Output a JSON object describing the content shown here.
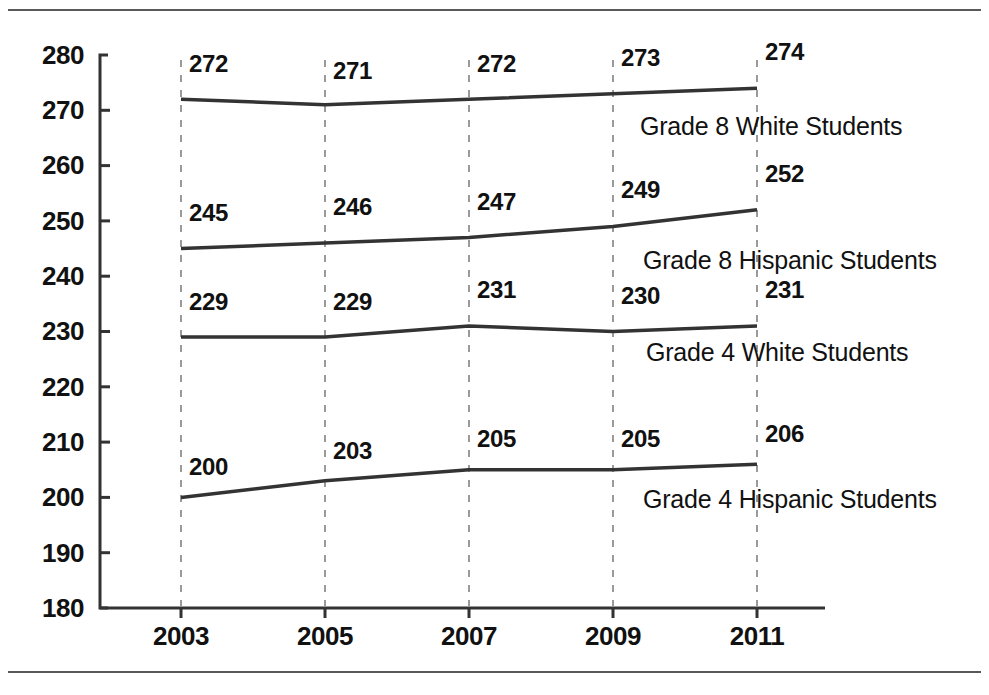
{
  "chart_data": {
    "type": "line",
    "title": "",
    "subtitle": "",
    "xlabel": "",
    "ylabel": "",
    "x": [
      2003,
      2005,
      2007,
      2009,
      2011
    ],
    "categories": [
      "2003",
      "2005",
      "2007",
      "2009",
      "2011"
    ],
    "xtick_labels": [
      "2003",
      "2005",
      "2007",
      "2009",
      "2011"
    ],
    "ytick_labels": [
      "280",
      "270",
      "260",
      "250",
      "240",
      "230",
      "220",
      "210",
      "200",
      "190",
      "180"
    ],
    "ytick_values": [
      280,
      270,
      260,
      250,
      240,
      230,
      220,
      210,
      200,
      190,
      180
    ],
    "ylim": [
      180,
      280
    ],
    "grid": "vertical-dashed",
    "legend_position": "inline-below-each-line",
    "line_color": "#333333",
    "series": [
      {
        "name": "Grade 8 White Students",
        "values": [
          272,
          271,
          272,
          273,
          274
        ],
        "point_labels": [
          "272",
          "271",
          "272",
          "273",
          "274"
        ]
      },
      {
        "name": "Grade 8 Hispanic Students",
        "values": [
          245,
          246,
          247,
          249,
          252
        ],
        "point_labels": [
          "245",
          "246",
          "247",
          "249",
          "252"
        ]
      },
      {
        "name": "Grade 4 White Students",
        "values": [
          229,
          229,
          231,
          230,
          231
        ],
        "point_labels": [
          "229",
          "229",
          "231",
          "230",
          "231"
        ]
      },
      {
        "name": "Grade 4 Hispanic Students",
        "values": [
          200,
          203,
          205,
          205,
          206
        ],
        "point_labels": [
          "200",
          "203",
          "205",
          "205",
          "206"
        ]
      }
    ]
  },
  "axis": {
    "y_ticks": [
      {
        "label": "280"
      },
      {
        "label": "270"
      },
      {
        "label": "260"
      },
      {
        "label": "250"
      },
      {
        "label": "240"
      },
      {
        "label": "230"
      },
      {
        "label": "220"
      },
      {
        "label": "210"
      },
      {
        "label": "200"
      },
      {
        "label": "190"
      },
      {
        "label": "180"
      }
    ],
    "x_ticks": [
      {
        "label": "2003"
      },
      {
        "label": "2005"
      },
      {
        "label": "2007"
      },
      {
        "label": "2009"
      },
      {
        "label": "2011"
      }
    ]
  },
  "value_labels": {
    "s0": [
      "272",
      "271",
      "272",
      "273",
      "274"
    ],
    "s1": [
      "245",
      "246",
      "247",
      "249",
      "252"
    ],
    "s2": [
      "229",
      "229",
      "231",
      "230",
      "231"
    ],
    "s3": [
      "200",
      "203",
      "205",
      "205",
      "206"
    ]
  },
  "series_labels": {
    "s0": "Grade 8 White Students",
    "s1": "Grade 8 Hispanic Students",
    "s2": "Grade 4 White Students",
    "s3": "Grade 4 Hispanic Students"
  }
}
